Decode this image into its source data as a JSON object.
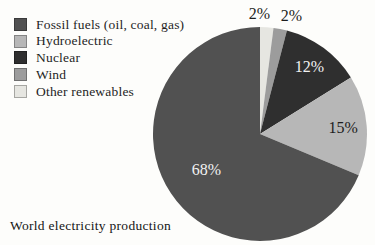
{
  "chart_data": {
    "type": "pie",
    "title": "World electricity production",
    "series": [
      {
        "label": "Fossil fuels (oil, coal, gas)",
        "value": 68,
        "value_label": "68%",
        "color": "#515151"
      },
      {
        "label": "Hydroelectric",
        "value": 15,
        "value_label": "15%",
        "color": "#b7b7b7"
      },
      {
        "label": "Nuclear",
        "value": 12,
        "value_label": "12%",
        "color": "#2f2f2f"
      },
      {
        "label": "Wind",
        "value": 2,
        "value_label": "2%",
        "color": "#9c9c9c"
      },
      {
        "label": "Other renewables",
        "value": 2,
        "value_label": "2%",
        "color": "#e6e6e1"
      }
    ],
    "draw_order_clockwise_from_top": [
      4,
      3,
      2,
      1,
      0
    ],
    "legend_position": "top-left",
    "value_label_colors": {
      "on_dark": "#f2f2f2",
      "on_light": "#1d1d1d"
    }
  }
}
